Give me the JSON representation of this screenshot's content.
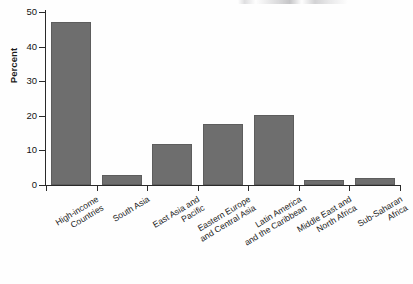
{
  "figure": {
    "ylabel": "Percent",
    "bar_color": "#6e6e6e",
    "axis_color": "#2a2a2a",
    "text_color": "#1c1c1c"
  },
  "chart_data": {
    "type": "bar",
    "title": "",
    "subtitle": "",
    "xlabel": "",
    "ylabel": "Percent",
    "ylim": [
      0,
      50
    ],
    "yticks": [
      0,
      10,
      20,
      30,
      40,
      50
    ],
    "ytick_labels": [
      "0",
      "10",
      "20",
      "30",
      "40",
      "50"
    ],
    "grid": false,
    "legend": false,
    "legend_position": "none",
    "orientation": "vertical",
    "categories": [
      "High-income\nCountries",
      "South Asia",
      "East Asia and\nPacific",
      "Eastern Europe\nand Central Asia",
      "Latin America\nand the Caribbean",
      "Middle East and\nNorth Africa",
      "Sub-Saharan\nAfrica"
    ],
    "category_lines": [
      [
        "High-income",
        "Countries"
      ],
      [
        "South Asia"
      ],
      [
        "East Asia and",
        "Pacific"
      ],
      [
        "Eastern Europe",
        "and Central Asia"
      ],
      [
        "Latin America",
        "and the Caribbean"
      ],
      [
        "Middle East and",
        "North Africa"
      ],
      [
        "Sub-Saharan",
        "Africa"
      ]
    ],
    "values": [
      47.2,
      2.9,
      11.9,
      17.6,
      20.2,
      1.5,
      2.0
    ]
  }
}
